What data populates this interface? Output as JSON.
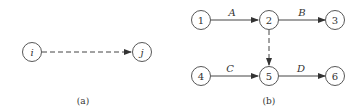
{
  "colors": {
    "stroke": "#444444",
    "background": "#ffffff"
  },
  "diagram_a": {
    "caption": "(a)",
    "nodes": [
      {
        "id": "i",
        "label": "i"
      },
      {
        "id": "j",
        "label": "j"
      }
    ],
    "edges": [
      {
        "from": "i",
        "to": "j",
        "style": "dashed",
        "label": ""
      }
    ]
  },
  "diagram_b": {
    "caption": "(b)",
    "nodes": [
      {
        "id": "1",
        "label": "1"
      },
      {
        "id": "2",
        "label": "2"
      },
      {
        "id": "3",
        "label": "3"
      },
      {
        "id": "4",
        "label": "4"
      },
      {
        "id": "5",
        "label": "5"
      },
      {
        "id": "6",
        "label": "6"
      }
    ],
    "edges": [
      {
        "from": "1",
        "to": "2",
        "style": "solid",
        "label": "A"
      },
      {
        "from": "2",
        "to": "3",
        "style": "solid",
        "label": "B"
      },
      {
        "from": "2",
        "to": "5",
        "style": "dashed",
        "label": ""
      },
      {
        "from": "4",
        "to": "5",
        "style": "solid",
        "label": "C"
      },
      {
        "from": "5",
        "to": "6",
        "style": "solid",
        "label": "D"
      }
    ]
  }
}
